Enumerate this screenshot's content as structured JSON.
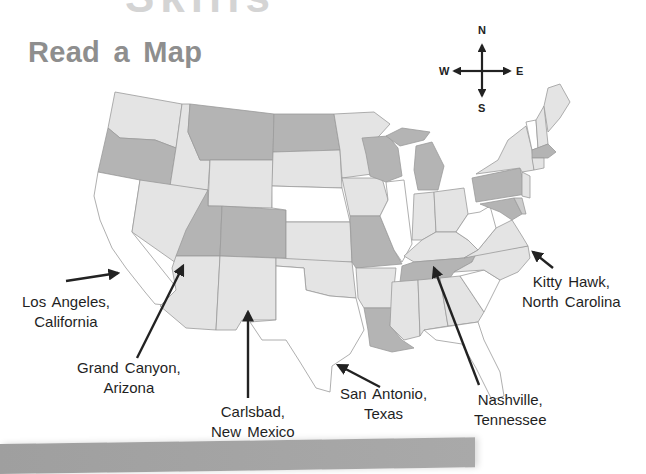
{
  "header": {
    "top_ghost_text": "Skills",
    "title": "Read a Map"
  },
  "compass": {
    "north": "N",
    "south": "S",
    "east": "E",
    "west": "W"
  },
  "colors": {
    "state_dark": "#b4b4b4",
    "state_mid": "#cdcdcd",
    "state_light": "#e4e4e4",
    "state_white": "#ffffff",
    "border": "#9a9a9a",
    "title": "#8e8e8e",
    "arrow": "#222222"
  },
  "map": {
    "region": "Continental United States",
    "states_dark": [
      "Oregon",
      "Montana",
      "North Dakota",
      "Utah",
      "Colorado",
      "Wisconsin",
      "Michigan",
      "Missouri",
      "Louisiana",
      "Tennessee",
      "Pennsylvania",
      "Massachusetts",
      "Maryland"
    ],
    "states_white": [
      "California",
      "Nebraska",
      "Texas",
      "Illinois",
      "West Virginia",
      "South Carolina",
      "Florida",
      "Vermont",
      "Mississippi (partial)"
    ]
  },
  "locations": [
    {
      "id": "los-angeles",
      "line1": "Los Angeles,",
      "line2": "California"
    },
    {
      "id": "grand-canyon",
      "line1": "Grand Canyon,",
      "line2": "Arizona"
    },
    {
      "id": "carlsbad",
      "line1": "Carlsbad,",
      "line2": "New Mexico"
    },
    {
      "id": "san-antonio",
      "line1": "San Antonio,",
      "line2": "Texas"
    },
    {
      "id": "nashville",
      "line1": "Nashville,",
      "line2": "Tennessee"
    },
    {
      "id": "kitty-hawk",
      "line1": "Kitty Hawk,",
      "line2": "North Carolina"
    }
  ]
}
